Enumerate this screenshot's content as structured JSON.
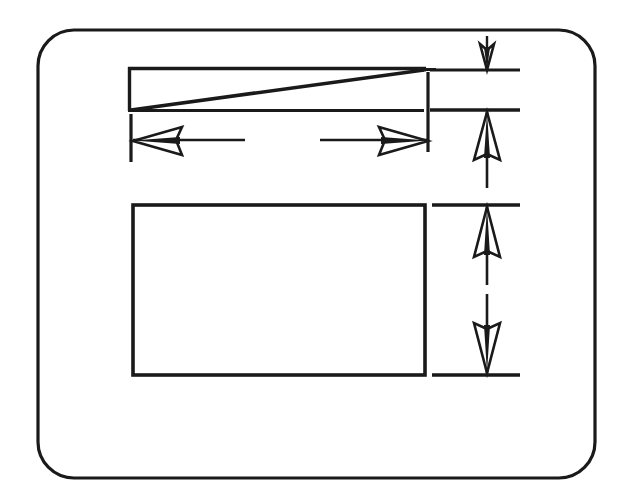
{
  "figure": {
    "background_color": "#ffffff",
    "ink_color": "#1a1a1a",
    "width": 626,
    "height": 500
  },
  "frame": {
    "name": "outer-rounded-frame",
    "x": 38,
    "y": 30,
    "width": 557,
    "height": 448,
    "corner_radius": 36,
    "stroke_width": 3.2
  },
  "shapes": {
    "wedge": {
      "label": "tapered-wedge",
      "x": 128,
      "y": 68,
      "width": 297,
      "height": 42,
      "stroke_width": 3.4,
      "diagonal_from": "bottom-left",
      "diagonal_to": "top-right"
    },
    "lower_rect": {
      "label": "lower-rectangle",
      "x": 133,
      "y": 205,
      "width": 292,
      "height": 170,
      "stroke_width": 3.6
    }
  },
  "dimensions": {
    "horizontal": {
      "label": "width-dimension",
      "axis_y": 140,
      "start_x": 133,
      "end_x": 428,
      "arrow_direction": "both",
      "arrow_length": 46,
      "arrow_half_height": 13,
      "extension_left": {
        "x": 133,
        "y1": 112,
        "y2": 162
      },
      "extension_right": {
        "x": 428,
        "y1": 72,
        "y2": 152
      }
    },
    "vertical_top_gap": {
      "label": "top-clearance-dimension",
      "axis_x": 487,
      "y1": 36,
      "y2": 70,
      "arrow_direction": "down",
      "arrow_length": 26,
      "arrow_half_width": 7,
      "witness_line": {
        "x1": 430,
        "x2": 520,
        "y": 70
      }
    },
    "vertical_wedge_depth": {
      "label": "wedge-depth-dimension",
      "axis_x": 487,
      "y1": 110,
      "y2": 188,
      "arrow_direction": "up",
      "arrow_length": 48,
      "arrow_half_width": 13,
      "witness_line": {
        "x1": 430,
        "x2": 520,
        "y": 110
      }
    },
    "vertical_rect_height": {
      "label": "rectangle-height-dimension",
      "axis_x": 487,
      "y_top": 205,
      "y_bottom": 375,
      "arrow_up": {
        "tip_y": 212,
        "tail_y": 290,
        "length": 50,
        "half_width": 13
      },
      "arrow_down": {
        "tip_y": 368,
        "tail_y": 290,
        "length": 50,
        "half_width": 13
      },
      "witness_line_top": {
        "x1": 430,
        "x2": 520,
        "y": 205
      },
      "witness_line_bottom": {
        "x1": 430,
        "x2": 520,
        "y": 375
      }
    }
  },
  "annotations": {
    "visible_text": []
  }
}
